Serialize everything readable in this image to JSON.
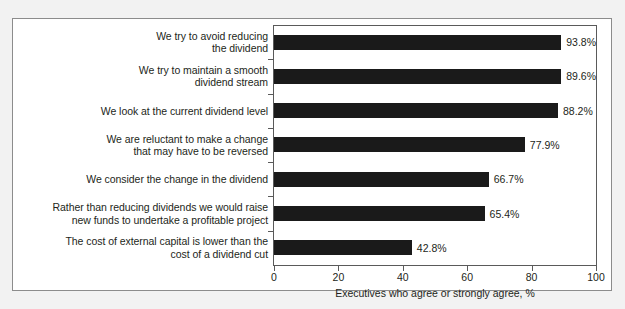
{
  "chart_data": {
    "type": "bar",
    "orientation": "horizontal",
    "title": "",
    "xlabel": "Executives who agree or strongly agree, %",
    "ylabel": "",
    "xlim": [
      0,
      100
    ],
    "xticks": [
      0,
      20,
      40,
      60,
      80,
      100
    ],
    "xtick_labels": [
      "0",
      "20",
      "40",
      "60",
      "80",
      "100"
    ],
    "grid": false,
    "legend": false,
    "bar_color": "#1a1a1a",
    "categories": [
      "We try to avoid reducing the dividend",
      "We try to maintain a smooth dividend stream",
      "We look at the current dividend level",
      "We are reluctant to make a change that may have to be reversed",
      "We consider the change in the dividend",
      "Rather than reducing dividends we would raise new funds to undertake a profitable project",
      "The cost of external capital is lower than the cost of a dividend cut"
    ],
    "category_lines": [
      [
        "We try to avoid reducing",
        "the dividend"
      ],
      [
        "We try to maintain a smooth",
        "dividend stream"
      ],
      [
        "We look at the current dividend level"
      ],
      [
        "We are reluctant to make a change",
        "that may have to be reversed"
      ],
      [
        "We consider the change in the dividend"
      ],
      [
        "Rather than reducing dividends we would raise",
        "new funds to undertake a profitable project"
      ],
      [
        "The cost of external capital is lower than the",
        "cost of a dividend cut"
      ]
    ],
    "values": [
      93.8,
      89.6,
      88.2,
      77.9,
      66.7,
      65.4,
      42.8
    ],
    "value_labels": [
      "93.8%",
      "89.6%",
      "88.2%",
      "77.9%",
      "66.7%",
      "65.4%",
      "42.8%"
    ]
  }
}
